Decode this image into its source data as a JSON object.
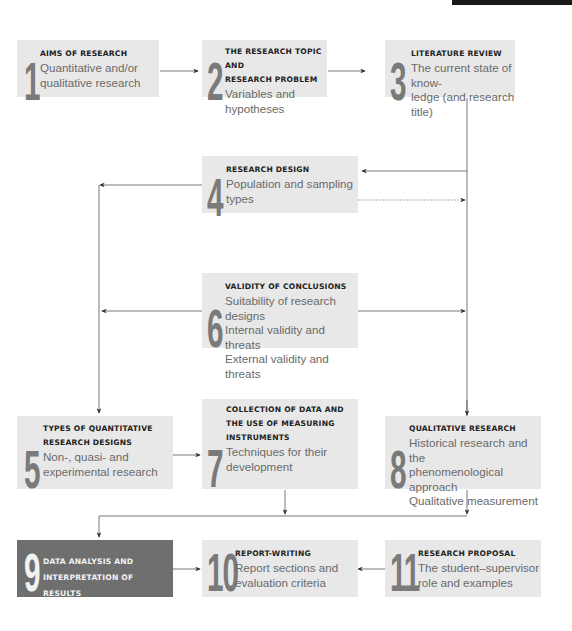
{
  "diagram": {
    "colors": {
      "box": "#e8e8e8",
      "highlight_box": "#6f6f6f",
      "number": "#7a7a7a",
      "line": "#555555"
    },
    "steps": [
      {
        "num": "1",
        "title": "Aims of research",
        "lines": [
          "Quantitative and/or",
          "qualitative research"
        ]
      },
      {
        "num": "2",
        "title": "The research topic and research problem",
        "title_lines": [
          "THE RESEARCH TOPIC AND",
          "RESEARCH PROBLEM"
        ],
        "lines": [
          "Variables and hypotheses"
        ]
      },
      {
        "num": "3",
        "title": "Literature review",
        "lines": [
          "The current state of know-",
          "ledge (and research title)"
        ]
      },
      {
        "num": "4",
        "title": "Research design",
        "lines": [
          "Population and sampling",
          "types"
        ]
      },
      {
        "num": "5",
        "title": "Types of quantitative research designs",
        "title_lines": [
          "TYPES OF QUANTITATIVE",
          "RESEARCH DESIGNS"
        ],
        "lines": [
          "Non-, quasi- and",
          "experimental research"
        ]
      },
      {
        "num": "6",
        "title": "Validity of conclusions",
        "lines": [
          "Suitability of research designs",
          "Internal validity and threats",
          "External validity and threats"
        ]
      },
      {
        "num": "7",
        "title": "Collection of data and the use of measuring instruments",
        "title_lines": [
          "COLLECTION OF DATA AND",
          "THE USE OF MEASURING",
          "INSTRUMENTS"
        ],
        "lines": [
          "Techniques for their",
          "development"
        ]
      },
      {
        "num": "8",
        "title": "Qualitative research",
        "lines": [
          "Historical research and the",
          "phenomenological approach",
          "Qualitative measurement"
        ]
      },
      {
        "num": "9",
        "title": "Data analysis and interpretation of results",
        "title_lines": [
          "DATA ANALYSIS AND",
          "INTERPRETATION OF RESULTS"
        ],
        "lines": []
      },
      {
        "num": "10",
        "title": "Report-writing",
        "lines": [
          "Report sections and",
          "evaluation criteria"
        ]
      },
      {
        "num": "11",
        "title": "Research proposal",
        "lines": [
          "The student–supervisor",
          "role and examples"
        ]
      }
    ]
  }
}
